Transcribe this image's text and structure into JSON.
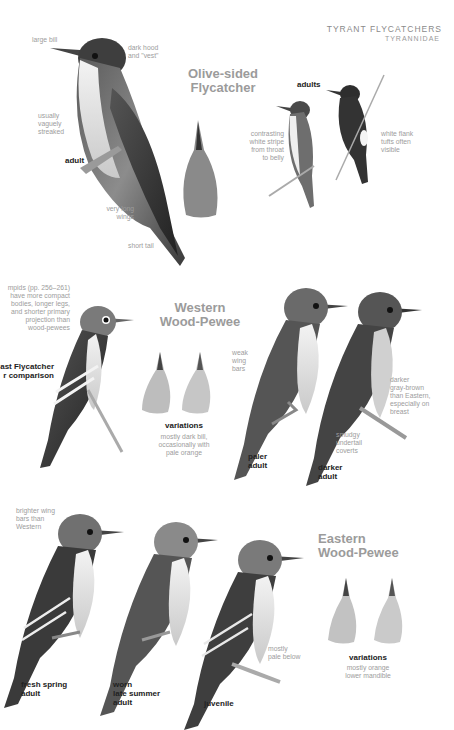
{
  "header": {
    "family_common": "TYRANT FLYCATCHERS",
    "family_latin": "TYRANNIDAE"
  },
  "sections": {
    "olive_sided": {
      "title_line1": "Olive-sided",
      "title_line2": "Flycatcher",
      "notes": {
        "bill": "large bill",
        "hood_1": "dark hood",
        "hood_2": "and \"vest\"",
        "streak_1": "usually",
        "streak_2": "vaguely",
        "streak_3": "streaked",
        "wings_1": "very long",
        "wings_2": "wings",
        "tail": "short tail",
        "stripe_1": "contrasting",
        "stripe_2": "white stripe",
        "stripe_3": "from throat",
        "stripe_4": "to belly",
        "flank_1": "white flank",
        "flank_2": "tufts often",
        "flank_3": "visible"
      },
      "labels": {
        "adult": "adult",
        "adults": "adults"
      }
    },
    "western": {
      "title_line1": "Western",
      "title_line2": "Wood-Pewee",
      "notes": {
        "empid_1": "mpids (pp. 256–261)",
        "empid_2": "have more compact",
        "empid_3": "bodies, longer legs,",
        "empid_4": "and shorter primary",
        "empid_5": "projection than",
        "empid_6": "wood-pewees",
        "weak_1": "weak",
        "weak_2": "wing",
        "weak_3": "bars",
        "var_1": "mostly dark bill,",
        "var_2": "occasionally with",
        "var_3": "pale orange",
        "darker_1": "darker",
        "darker_2": "gray-brown",
        "darker_3": "than Eastern,",
        "darker_4": "especially on",
        "darker_5": "breast",
        "smudgy_1": "smudgy",
        "smudgy_2": "undertail",
        "smudgy_3": "coverts"
      },
      "labels": {
        "compare_1": "ast Flycatcher",
        "compare_2": "r comparison",
        "variations": "variations",
        "paler_1": "paler",
        "paler_2": "adult",
        "darker_1": "darker",
        "darker_2": "adult"
      }
    },
    "eastern": {
      "title_line1": "Eastern",
      "title_line2": "Wood-Pewee",
      "notes": {
        "bright_1": "brighter wing",
        "bright_2": "bars than",
        "bright_3": "Western",
        "pale_1": "mostly",
        "pale_2": "pale below",
        "var_1": "mostly orange",
        "var_2": "lower mandible"
      },
      "labels": {
        "fresh_1": "fresh spring",
        "fresh_2": "adult",
        "worn_1": "worn",
        "worn_2": "late summer",
        "worn_3": "adult",
        "juvenile": "juvenile",
        "variations": "variations"
      }
    }
  },
  "colors": {
    "heading": "#9b9b9b",
    "note": "#9d9d9d",
    "label": "#222222"
  }
}
